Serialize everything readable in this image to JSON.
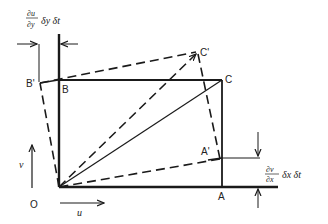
{
  "figure": {
    "points": {
      "O": "O",
      "A": "A",
      "B": "B",
      "C": "C",
      "A_prime": "A'",
      "B_prime": "B'",
      "C_prime": "C'"
    },
    "velocity_labels": {
      "u": "u",
      "v": "v"
    },
    "annotations": {
      "top_num": "∂u",
      "top_den": "∂y",
      "top_tail": "δy δt",
      "right_num": "∂v",
      "right_den": "∂x",
      "right_tail": "δx δt"
    },
    "colors": {
      "line": "#1a1a1a",
      "background": "#ffffff"
    }
  }
}
